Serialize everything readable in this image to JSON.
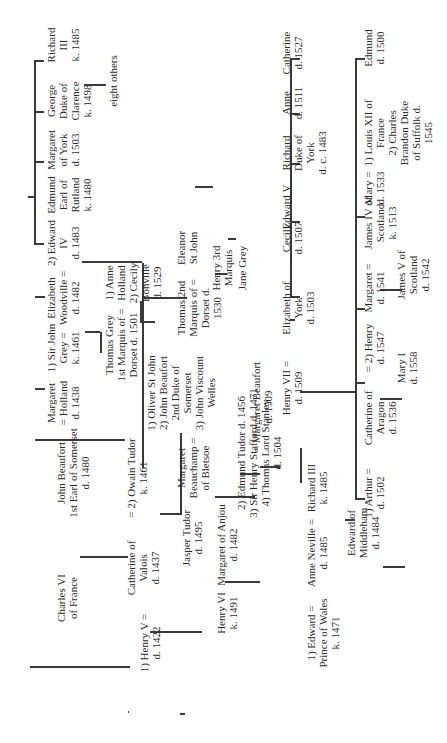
{
  "diagram": {
    "orientation": "rotated-90-ccw",
    "line_color": "#3a3a3a",
    "text_color": "#2a2a2a",
    "background": "#ffffff",
    "nodes": {
      "charles_vi": "Charles VI\nof France",
      "john_beaufort": "John Beaufort\n1st Earl of Somerset\nd. 1480",
      "margaret_holland": "Margaret\n= Holland\nd. 1438",
      "sir_john_grey": "1) Sir John\nGrey =\nk. 1461",
      "elizabeth_woodville": "Elizabeth\nWoodville =\nd. 1482",
      "edward_iv": "2) Edward\nIV\nd. 1483",
      "edmund_rutland": "Edmund\nEarl of\nRutland\nk. 1480",
      "margaret_york": "Margaret\nof York\nd. 1503",
      "george_clarence": "George\nDuke of\nClarence\nk. 1498",
      "richard_iii_top": "Richard\nIII\nk. 1485",
      "eight_others": "eight others",
      "henry_v": "1) Henry V =\nd. 1422",
      "catherine_valois": "Catherine of\nValois\nd. 1437",
      "owain_tudor": "= 2) Owain Tudor\nk. 1461",
      "jasper_tudor": "Jasper Tudor\nd. 1495",
      "margaret_beauchamp": "Margaret\nBeauchamp =\nof Bletsoe",
      "beauchamp_husbands": "1) Oliver St John\n2) John Beaufort\n2nd Duke of\nSomerset\n3) John Viscount\nWelles",
      "thomas_grey_1st": "Thomas Grey\n1st Marquis of =\nDorset d. 1501",
      "thomas_grey_wives": "1) Anne\nHolland\n2) Cecily\nBonville\nd. 1529",
      "thomas_2nd_marquis": "Thomas 2nd\nMarquis of =\nDorset d.\n1530",
      "eleanor_st_john": "Eleanor\nSt John",
      "henry_3rd_marquis": "Henry 3rd\nMarquis",
      "jane_grey": "Jane Grey",
      "henry_vi": "Henry VI\nk. 1491",
      "margaret_anjou": "Margaret of Anjou\nd. 1482",
      "margaret_beaufort_husbands": "2) Edmund Tudor d. 1456\n3) Sir Henry Stafford d. 1471\n4) Thomas Lord Stanley\nd. 1504",
      "margaret_beaufort": "= Margaret Beaufort\nd. 1509",
      "henry_vii": "Henry VII =\nd. 1509",
      "elizabeth_york": "Elizabeth of\nYork\nd. 1503",
      "cecily": "Cecily\nd. 1507",
      "edward_v": "Edward V",
      "richard_duke_york": "Richard\nDuke of\nYork\nd. c. 1483",
      "anne": "Anne\nd. 1511",
      "catherine": "Catherine\nd. 1527",
      "edward_prince_wales": "1) Edward =\nPrince of Wales\nk. 1471",
      "anne_neville": "Anne Neville =\nd. 1485",
      "richard_iii": "Richard III\nk. 1485",
      "edward_middleham": "Edward of\nMiddleham\nd. 1484",
      "arthur": "1) Arthur =\nd. 1502",
      "catherine_aragon": "Catherine of\nAragon\nd. 1536",
      "henry_viii": "= 2) Henry\nd. 1547",
      "mary_i": "Mary I\nd. 1558",
      "margaret_tudor": "Margaret =\nd. 1541",
      "james_iv": "James IV of\nScotland\nk. 1513",
      "james_v": "James V of\nScotland\nd. 1542",
      "mary_tudor": "Mary =\nd. 1533",
      "mary_husbands": "1) Louis XII of\nFrance\n2) Charles\nBrandon Duke\nof Suffolk d.\n1545",
      "edmund": "Edmund\nd. 1500"
    }
  }
}
